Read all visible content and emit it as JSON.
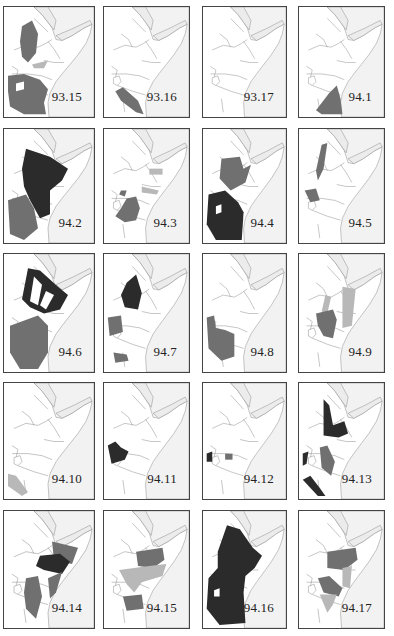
{
  "figure": {
    "shade_colors": {
      "dark": "#2b2b2b",
      "medium": "#707070",
      "light": "#b8b8b8",
      "sea": "#f2f2f2",
      "border": "#8a8a8a"
    },
    "maps": [
      {
        "label": "93.15"
      },
      {
        "label": "93.16"
      },
      {
        "label": "93.17"
      },
      {
        "label": "94.1"
      },
      {
        "label": "94.2"
      },
      {
        "label": "94.3"
      },
      {
        "label": "94.4"
      },
      {
        "label": "94.5"
      },
      {
        "label": "94.6"
      },
      {
        "label": "94.7"
      },
      {
        "label": "94.8"
      },
      {
        "label": "94.9"
      },
      {
        "label": "94.10"
      },
      {
        "label": "94.11"
      },
      {
        "label": "94.12"
      },
      {
        "label": "94.13"
      },
      {
        "label": "94.14"
      },
      {
        "label": "94.15"
      },
      {
        "label": "94.16"
      },
      {
        "label": "94.17"
      }
    ]
  }
}
